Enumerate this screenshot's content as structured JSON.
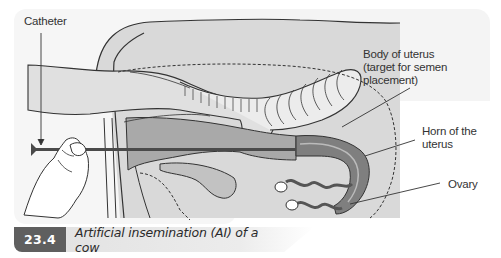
{
  "figure": {
    "labels": {
      "catheter": "Catheter",
      "body_of_uterus_line1": "Body of uterus",
      "body_of_uterus_line2": "(target for semen placement)",
      "horn_line1": "Horn of the",
      "horn_line2": "uterus",
      "ovary": "Ovary"
    },
    "colors": {
      "background_panel": "#f4f4f4",
      "anatomy_fill": "#d4d4d4",
      "tract_fill": "#a9a9a9",
      "horn_dark": "#808080",
      "outline": "#333333",
      "catheter": "#4a4a4a"
    }
  },
  "caption": {
    "number": "23.4",
    "text": "Artificial insemination (AI) of a cow"
  }
}
